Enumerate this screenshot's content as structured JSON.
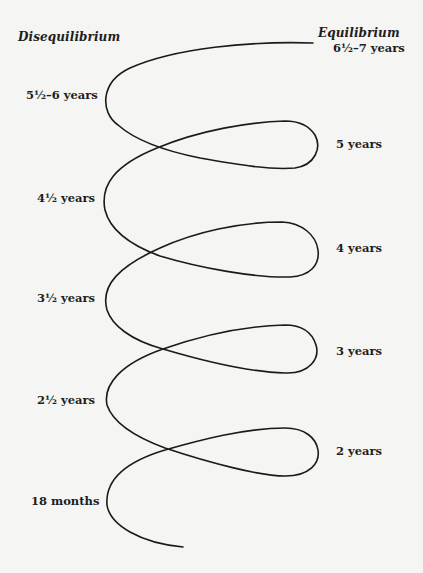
{
  "diagram": {
    "headings": {
      "left": "Disequilibrium",
      "right": "Equilibrium"
    },
    "left_labels": [
      {
        "label": "5½–6 years"
      },
      {
        "label": "4½ years"
      },
      {
        "label": "3½ years"
      },
      {
        "label": "2½ years"
      },
      {
        "label": "18 months"
      }
    ],
    "right_labels": [
      {
        "label": "6½–7 years"
      },
      {
        "label": "5 years"
      },
      {
        "label": "4 years"
      },
      {
        "label": "3 years"
      },
      {
        "label": "2 years"
      }
    ],
    "curve": {
      "description": "Spiral line alternating between disequilibrium (left) and equilibrium (right) stages, rising from 18 months at bottom to 6½–7 years at top",
      "stroke_color": "#1a1a1a"
    }
  }
}
